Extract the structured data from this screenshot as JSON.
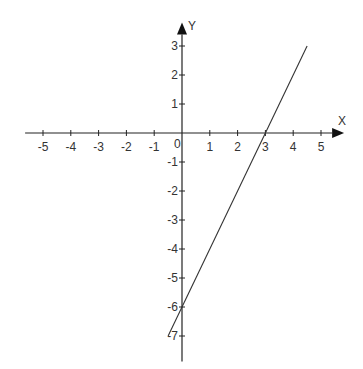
{
  "chart_data": {
    "type": "line",
    "title": "",
    "xlabel": "X",
    "ylabel": "Y",
    "xlim": [
      -5.5,
      5.4
    ],
    "ylim": [
      -7.6,
      3.4
    ],
    "x_ticks": [
      -5,
      -4,
      -3,
      -2,
      -1,
      1,
      2,
      3,
      4,
      5
    ],
    "y_ticks": [
      -7,
      -6,
      -5,
      -4,
      -3,
      -2,
      -1,
      1,
      2,
      3
    ],
    "origin_label": "0",
    "grid": false,
    "legend": "none",
    "series": [
      {
        "name": "y = 2x - 6",
        "x": [
          -0.5,
          4.5
        ],
        "y": [
          -7,
          3
        ]
      }
    ],
    "colors": {
      "axis": "#222222",
      "line": "#333333",
      "text": "#333333"
    }
  }
}
